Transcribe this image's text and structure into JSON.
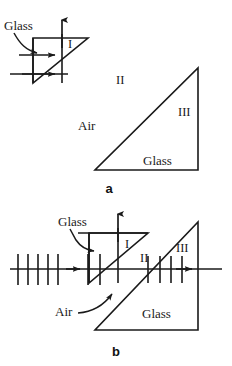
{
  "figure": {
    "background_color": "#ffffff",
    "line_color": "#1a1a1a",
    "width": 232,
    "height": 366
  },
  "panels": [
    {
      "id": "a",
      "panel_label": "a",
      "description": "Small glass prism with incoming rays at left, separate large glass prism at right in air",
      "labels": {
        "glass_small": "Glass",
        "region_one": "I",
        "region_two": "II",
        "region_three": "III",
        "air": "Air",
        "glass_large": "Glass"
      }
    },
    {
      "id": "b",
      "panel_label": "b",
      "description": "Small glass prism overlapping large glass prism, wavefront ticks along the horizontal ray",
      "labels": {
        "glass_small": "Glass",
        "region_one": "I",
        "region_two": "II",
        "region_three": "III",
        "air": "Air",
        "glass_large": "Glass"
      },
      "tick_counts": {
        "left_segment": 5,
        "right_segment": 4
      }
    }
  ],
  "annotations": {
    "glass_callout_label": "Glass",
    "air_callout_label": "Air"
  }
}
